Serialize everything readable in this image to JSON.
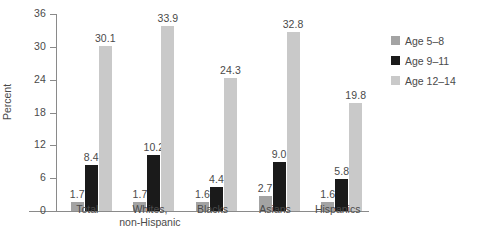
{
  "chart_data": {
    "type": "bar",
    "title": "",
    "xlabel": "",
    "ylabel": "Percent",
    "ylim": [
      0,
      36
    ],
    "yticks": [
      0,
      6,
      12,
      18,
      24,
      30,
      36
    ],
    "grid": false,
    "legend_position": "right",
    "categories": [
      "Total",
      "Whites,\nnon-Hispanic",
      "Blacks",
      "Asians",
      "Hispanics"
    ],
    "series": [
      {
        "name": "Age 5–8",
        "color": "#a3a3a3",
        "values": [
          1.7,
          1.7,
          1.6,
          2.7,
          1.6
        ],
        "labels": [
          "1.7",
          "1.7",
          "1.6",
          "2.7",
          "1.6"
        ]
      },
      {
        "name": "Age 9–11",
        "color": "#1a1a1a",
        "values": [
          8.4,
          10.2,
          4.4,
          9.0,
          5.8
        ],
        "labels": [
          "8.4",
          "10.2",
          "4.4",
          "9.0",
          "5.8"
        ]
      },
      {
        "name": "Age 12–14",
        "color": "#c9c9c9",
        "values": [
          30.1,
          33.9,
          24.3,
          32.8,
          19.8
        ],
        "labels": [
          "30.1",
          "33.9",
          "24.3",
          "32.8",
          "19.8"
        ]
      }
    ]
  },
  "axis": {
    "y_label": "Percent",
    "tick_labels": [
      "36",
      "30",
      "24",
      "18",
      "12",
      "6",
      "0"
    ]
  },
  "legend": {
    "items": [
      {
        "label": "Age 5–8",
        "color": "#a3a3a3"
      },
      {
        "label": "Age 9–11",
        "color": "#1a1a1a"
      },
      {
        "label": "Age 12–14",
        "color": "#c9c9c9"
      }
    ]
  }
}
